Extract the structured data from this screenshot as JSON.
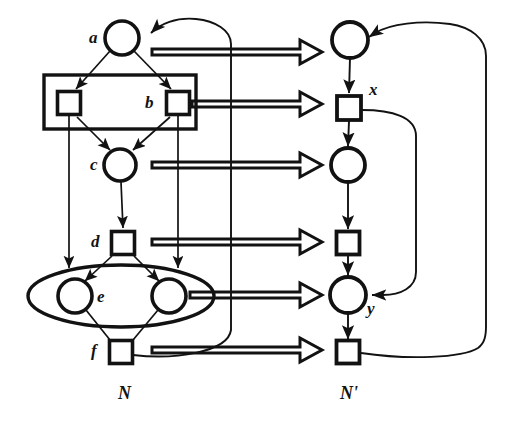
{
  "figure": {
    "kind": "petri-net-refinement-diagram",
    "colors": {
      "ink": "#121212",
      "background": "#ffffff",
      "node_fill": "#ffffff"
    },
    "nets": [
      {
        "id": "N",
        "caption": "N",
        "caption_position": {
          "x": 118,
          "y": 384
        }
      },
      {
        "id": "Nprime",
        "caption": "N'",
        "caption_position": {
          "x": 340,
          "y": 384
        }
      }
    ],
    "labels": [
      {
        "name": "label-a",
        "text": "a",
        "x": 89,
        "y": 29
      },
      {
        "name": "label-b",
        "text": "b",
        "x": 145,
        "y": 94
      },
      {
        "name": "label-c",
        "text": "c",
        "x": 90,
        "y": 156
      },
      {
        "name": "label-d",
        "text": "d",
        "x": 91,
        "y": 233
      },
      {
        "name": "label-e",
        "text": "e",
        "x": 97,
        "y": 288
      },
      {
        "name": "label-f",
        "text": "f",
        "x": 91,
        "y": 342
      },
      {
        "name": "label-x",
        "text": "x",
        "x": 369,
        "y": 81
      },
      {
        "name": "label-y",
        "text": "y",
        "x": 367,
        "y": 300
      }
    ],
    "left_net_nodes": [
      {
        "name": "place-a",
        "type": "place",
        "cx": 122,
        "cy": 38,
        "r": 17
      },
      {
        "name": "transition-b-left",
        "type": "transition",
        "cx": 69,
        "cy": 103,
        "size": 23
      },
      {
        "name": "transition-b-right",
        "type": "transition",
        "cx": 178,
        "cy": 103,
        "size": 23
      },
      {
        "name": "place-c",
        "type": "place",
        "cx": 120,
        "cy": 165,
        "r": 16
      },
      {
        "name": "transition-d",
        "type": "transition",
        "cx": 123,
        "cy": 243,
        "size": 23
      },
      {
        "name": "place-e-left",
        "type": "place",
        "cx": 75,
        "cy": 296,
        "r": 17
      },
      {
        "name": "place-e-right",
        "type": "place",
        "cx": 169,
        "cy": 296,
        "r": 17
      },
      {
        "name": "transition-f",
        "type": "transition",
        "cx": 121,
        "cy": 352,
        "size": 23
      }
    ],
    "left_net_groups": [
      {
        "name": "group-box-b",
        "shape": "rectangle",
        "x": 44,
        "y": 75,
        "width": 152,
        "height": 54
      },
      {
        "name": "group-ellipse-e",
        "shape": "ellipse",
        "cx": 121,
        "cy": 296,
        "rx": 93,
        "ry": 31
      }
    ],
    "right_net_nodes": [
      {
        "name": "place-a-prime",
        "type": "place",
        "cx": 350,
        "cy": 40,
        "r": 18
      },
      {
        "name": "transition-x",
        "type": "transition",
        "cx": 349,
        "cy": 108,
        "size": 24
      },
      {
        "name": "place-middle",
        "type": "place",
        "cx": 348,
        "cy": 165,
        "r": 17
      },
      {
        "name": "transition-middle",
        "type": "transition",
        "cx": 348,
        "cy": 243,
        "size": 23
      },
      {
        "name": "place-y",
        "type": "place",
        "cx": 348,
        "cy": 295,
        "r": 18
      },
      {
        "name": "transition-bottom",
        "type": "transition",
        "cx": 348,
        "cy": 352,
        "size": 23
      }
    ],
    "mapping_arrows": [
      {
        "name": "mapping-arrow-a",
        "from_y": 49,
        "to_x": 322,
        "start_x": 152
      },
      {
        "name": "mapping-arrow-b",
        "from_y": 104,
        "to_x": 322,
        "start_x": 192
      },
      {
        "name": "mapping-arrow-c",
        "from_y": 165,
        "to_x": 322,
        "start_x": 152
      },
      {
        "name": "mapping-arrow-d",
        "from_y": 242,
        "to_x": 322,
        "start_x": 152
      },
      {
        "name": "mapping-arrow-e",
        "from_y": 295,
        "to_x": 322,
        "start_x": 190
      },
      {
        "name": "mapping-arrow-f",
        "from_y": 350,
        "to_x": 322,
        "start_x": 152
      }
    ],
    "feedback_loops": [
      {
        "name": "feedback-outer-right",
        "from": "transition-bottom",
        "to": "place-a-prime",
        "turn_x": 480
      },
      {
        "name": "feedback-inner-right",
        "from": "transition-x",
        "to": "place-y",
        "turn_x": 416
      },
      {
        "name": "feedback-left-net",
        "from": "transition-f",
        "to": "place-a",
        "turn_x": 231
      }
    ]
  }
}
